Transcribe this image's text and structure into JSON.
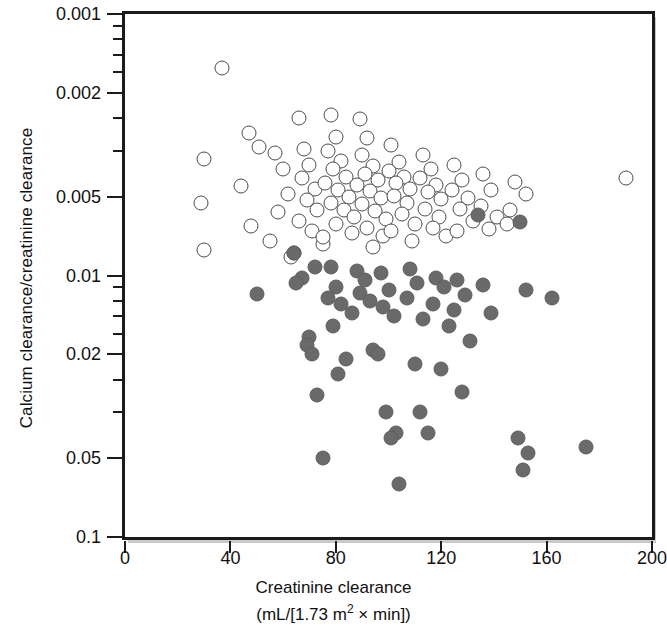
{
  "axes": {
    "y_title": "Calcium clearance/creatinine clearance",
    "x_title_line1": "Creatinine clearance",
    "x_title_line2_pre": "(mL/[1.73 m",
    "x_title_line2_sup": "2",
    "x_title_line2_post": " × min])",
    "y_ticklabels": [
      "0.1",
      "0.05",
      "0.02",
      "0.01",
      "0.005",
      "0.002",
      "0.001"
    ],
    "x_ticklabels": [
      "0",
      "40",
      "80",
      "120",
      "160",
      "200"
    ]
  },
  "colors": {
    "frame": "#1b1b1b",
    "frame_shadow": "#c9c9c9",
    "open_marker_edge": "#4c4c4c",
    "filled_marker": "#6a6a6a",
    "background": "#ffffff"
  },
  "chart_data": {
    "type": "scatter",
    "title": "",
    "xlabel": "Creatinine clearance (mL/[1.73 m2 x min])",
    "ylabel": "Calcium clearance/creatinine clearance",
    "xlim": [
      0,
      200
    ],
    "ylim": [
      0.001,
      0.1
    ],
    "yscale": "log",
    "xscale": "linear",
    "grid": false,
    "legend": "none",
    "xticks": [
      0,
      40,
      80,
      120,
      160,
      200
    ],
    "yticks": [
      0.001,
      0.002,
      0.005,
      0.01,
      0.02,
      0.05,
      0.1
    ],
    "series": [
      {
        "name": "open circles",
        "marker": "open-circle",
        "points": [
          [
            37,
            0.062
          ],
          [
            30,
            0.028
          ],
          [
            29,
            0.019
          ],
          [
            30,
            0.0125
          ],
          [
            47,
            0.035
          ],
          [
            51,
            0.031
          ],
          [
            44,
            0.022
          ],
          [
            48,
            0.0155
          ],
          [
            57,
            0.0295
          ],
          [
            60,
            0.0255
          ],
          [
            62,
            0.0205
          ],
          [
            58,
            0.0175
          ],
          [
            55,
            0.0135
          ],
          [
            63,
            0.0118
          ],
          [
            66,
            0.04
          ],
          [
            68,
            0.0305
          ],
          [
            70,
            0.0265
          ],
          [
            67,
            0.0235
          ],
          [
            72,
            0.0215
          ],
          [
            69,
            0.0195
          ],
          [
            73,
            0.0178
          ],
          [
            66,
            0.0162
          ],
          [
            71,
            0.0148
          ],
          [
            75,
            0.0132
          ],
          [
            64,
            0.0122
          ],
          [
            78,
            0.041
          ],
          [
            80,
            0.034
          ],
          [
            77,
            0.03
          ],
          [
            82,
            0.0275
          ],
          [
            79,
            0.0255
          ],
          [
            84,
            0.0238
          ],
          [
            76,
            0.0225
          ],
          [
            81,
            0.0212
          ],
          [
            85,
            0.02
          ],
          [
            78,
            0.019
          ],
          [
            83,
            0.0178
          ],
          [
            87,
            0.0168
          ],
          [
            80,
            0.0158
          ],
          [
            86,
            0.0146
          ],
          [
            75,
            0.014
          ],
          [
            89,
            0.0395
          ],
          [
            92,
            0.0335
          ],
          [
            90,
            0.0288
          ],
          [
            94,
            0.0262
          ],
          [
            91,
            0.0245
          ],
          [
            96,
            0.0232
          ],
          [
            88,
            0.0222
          ],
          [
            93,
            0.021
          ],
          [
            97,
            0.0198
          ],
          [
            90,
            0.0188
          ],
          [
            95,
            0.0176
          ],
          [
            99,
            0.0164
          ],
          [
            92,
            0.0152
          ],
          [
            98,
            0.0142
          ],
          [
            94,
            0.0128
          ],
          [
            101,
            0.0315
          ],
          [
            104,
            0.0272
          ],
          [
            100,
            0.025
          ],
          [
            106,
            0.0238
          ],
          [
            103,
            0.0226
          ],
          [
            108,
            0.0214
          ],
          [
            102,
            0.0202
          ],
          [
            107,
            0.019
          ],
          [
            105,
            0.0172
          ],
          [
            110,
            0.0158
          ],
          [
            101,
            0.0148
          ],
          [
            109,
            0.0135
          ],
          [
            113,
            0.029
          ],
          [
            116,
            0.0255
          ],
          [
            112,
            0.0236
          ],
          [
            118,
            0.0222
          ],
          [
            115,
            0.0208
          ],
          [
            120,
            0.0196
          ],
          [
            114,
            0.018
          ],
          [
            119,
            0.0168
          ],
          [
            117,
            0.0152
          ],
          [
            122,
            0.0142
          ],
          [
            125,
            0.0265
          ],
          [
            128,
            0.0232
          ],
          [
            124,
            0.0212
          ],
          [
            130,
            0.0198
          ],
          [
            127,
            0.018
          ],
          [
            132,
            0.0162
          ],
          [
            126,
            0.0148
          ],
          [
            136,
            0.0245
          ],
          [
            139,
            0.0212
          ],
          [
            135,
            0.0185
          ],
          [
            141,
            0.0168
          ],
          [
            138,
            0.015
          ],
          [
            148,
            0.0228
          ],
          [
            152,
            0.0205
          ],
          [
            146,
            0.0178
          ],
          [
            145,
            0.0158
          ],
          [
            190,
            0.0235
          ]
        ]
      },
      {
        "name": "filled circles",
        "marker": "filled-circle",
        "points": [
          [
            50,
            0.0085
          ],
          [
            64,
            0.0122
          ],
          [
            67,
            0.0098
          ],
          [
            65,
            0.0094
          ],
          [
            72,
            0.0108
          ],
          [
            70,
            0.0058
          ],
          [
            69,
            0.0054
          ],
          [
            71,
            0.005
          ],
          [
            73,
            0.0035
          ],
          [
            75,
            0.002
          ],
          [
            78,
            0.0108
          ],
          [
            80,
            0.009
          ],
          [
            77,
            0.0082
          ],
          [
            82,
            0.0078
          ],
          [
            79,
            0.0064
          ],
          [
            84,
            0.0048
          ],
          [
            81,
            0.0042
          ],
          [
            88,
            0.0104
          ],
          [
            91,
            0.0096
          ],
          [
            89,
            0.0086
          ],
          [
            93,
            0.008
          ],
          [
            86,
            0.0072
          ],
          [
            94,
            0.0052
          ],
          [
            97,
            0.0102
          ],
          [
            100,
            0.0088
          ],
          [
            98,
            0.0076
          ],
          [
            102,
            0.007
          ],
          [
            96,
            0.005
          ],
          [
            99,
            0.003
          ],
          [
            103,
            0.0025
          ],
          [
            101,
            0.0024
          ],
          [
            104,
            0.0016
          ],
          [
            108,
            0.0106
          ],
          [
            111,
            0.0094
          ],
          [
            107,
            0.0082
          ],
          [
            113,
            0.0068
          ],
          [
            110,
            0.0046
          ],
          [
            112,
            0.003
          ],
          [
            115,
            0.0025
          ],
          [
            118,
            0.0098
          ],
          [
            121,
            0.009
          ],
          [
            117,
            0.0078
          ],
          [
            123,
            0.0064
          ],
          [
            120,
            0.0044
          ],
          [
            126,
            0.0096
          ],
          [
            129,
            0.0084
          ],
          [
            125,
            0.0074
          ],
          [
            131,
            0.0056
          ],
          [
            128,
            0.0036
          ],
          [
            134,
            0.017
          ],
          [
            136,
            0.0092
          ],
          [
            139,
            0.0072
          ],
          [
            150,
            0.016
          ],
          [
            152,
            0.0088
          ],
          [
            149,
            0.0024
          ],
          [
            153,
            0.0021
          ],
          [
            151,
            0.0018
          ],
          [
            162,
            0.0082
          ],
          [
            175,
            0.0022
          ]
        ]
      }
    ]
  }
}
